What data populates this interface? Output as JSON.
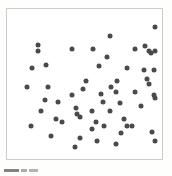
{
  "figure": {
    "width": 172,
    "height": 176,
    "background_color": "#fefefd",
    "caption_fragment": "Fig 1"
  },
  "plot": {
    "frame_color": "#cccccc",
    "plot_background": "#ffffff",
    "marker_color": "#4a4a4a",
    "marker_size_px": 5,
    "marker_shape": "circle"
  },
  "chart_data": {
    "type": "scatter",
    "title": "",
    "subtitle": "",
    "xlabel": "",
    "ylabel": "",
    "xlim": [
      0,
      100
    ],
    "ylim": [
      0,
      100
    ],
    "grid": false,
    "legend": null,
    "legend_position": "none",
    "annotations": [],
    "tick_labels": {
      "x": [],
      "y": []
    },
    "n_points": 60,
    "series": [
      {
        "name": "points",
        "color": "#4a4a4a",
        "marker": "circle",
        "points": [
          [
            17.0,
            79.0
          ],
          [
            17.0,
            74.0
          ],
          [
            41.0,
            76.0
          ],
          [
            56.0,
            76.0
          ],
          [
            68.0,
            85.0
          ],
          [
            66.0,
            70.0
          ],
          [
            86.0,
            76.0
          ],
          [
            93.0,
            78.0
          ],
          [
            96.0,
            74.0
          ],
          [
            97.0,
            73.0
          ],
          [
            100.0,
            74.0
          ],
          [
            13.0,
            62.0
          ],
          [
            23.0,
            64.0
          ],
          [
            80.0,
            62.0
          ],
          [
            92.0,
            60.0
          ],
          [
            99.0,
            60.0
          ],
          [
            73.0,
            52.0
          ],
          [
            69.0,
            48.0
          ],
          [
            62.0,
            43.0
          ],
          [
            72.0,
            44.0
          ],
          [
            94.0,
            54.0
          ],
          [
            96.0,
            50.0
          ],
          [
            86.0,
            44.0
          ],
          [
            99.0,
            42.0
          ],
          [
            100.0,
            40.0
          ],
          [
            22.0,
            38.0
          ],
          [
            31.0,
            37.0
          ],
          [
            19.0,
            30.0
          ],
          [
            44.0,
            32.0
          ],
          [
            45.0,
            28.0
          ],
          [
            47.0,
            26.0
          ],
          [
            55.0,
            30.0
          ],
          [
            63.0,
            37.0
          ],
          [
            75.0,
            36.0
          ],
          [
            68.0,
            30.0
          ],
          [
            90.0,
            34.0
          ],
          [
            58.0,
            22.0
          ],
          [
            64.0,
            19.0
          ],
          [
            80.0,
            19.0
          ],
          [
            84.0,
            19.0
          ],
          [
            76.0,
            14.0
          ],
          [
            98.0,
            15.0
          ],
          [
            12.0,
            19.0
          ],
          [
            26.0,
            12.0
          ],
          [
            47.0,
            10.0
          ],
          [
            43.0,
            4.0
          ],
          [
            59.0,
            8.0
          ],
          [
            72.0,
            6.0
          ],
          [
            100.0,
            8.0
          ],
          [
            49.0,
            46.0
          ],
          [
            51.0,
            52.0
          ],
          [
            78.0,
            24.0
          ],
          [
            30.0,
            24.0
          ],
          [
            34.0,
            22.0
          ],
          [
            55.0,
            17.0
          ],
          [
            9.0,
            48.0
          ],
          [
            60.0,
            63.0
          ],
          [
            41.0,
            42.0
          ],
          [
            24.0,
            48.0
          ],
          [
            100.0,
            92.0
          ]
        ]
      }
    ]
  }
}
